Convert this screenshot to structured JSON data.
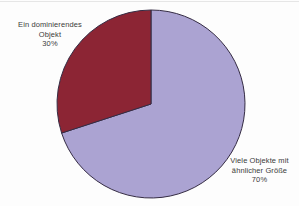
{
  "chart_data": {
    "type": "pie",
    "title": "",
    "start_angle_deg": 0,
    "direction": "clockwise",
    "outline_color": "#352c44",
    "legend_position": "none",
    "slices": [
      {
        "label": "Viele Objekte mit ähnlicher Größe",
        "value": 70,
        "percent_label": "70%",
        "color": "#aba3d2",
        "label_lines": [
          "Viele Objekte mit",
          "ähnlicher Größe",
          "70%"
        ]
      },
      {
        "label": "Ein dominierendes Objekt",
        "value": 30,
        "percent_label": "30%",
        "color": "#8c2534",
        "label_lines": [
          "Ein dominierendes",
          "Objekt",
          "30%"
        ]
      }
    ]
  }
}
